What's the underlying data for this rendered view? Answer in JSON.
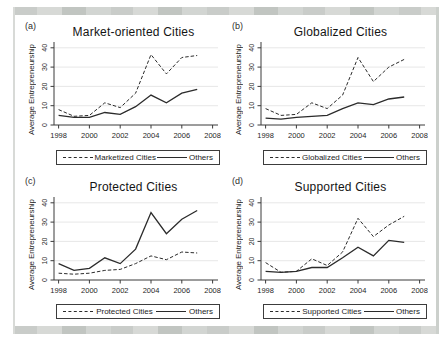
{
  "figure": {
    "background": "#ffffff",
    "frame_band_color": "#c9ccc9",
    "line_color": "#2b2b2b",
    "axis_color": "#3a3a3a",
    "grid_color": "#dcdcdc",
    "text_color": "#1f1f1f"
  },
  "axes": {
    "ylabel": "Average Entrepreneurship",
    "yticks": [
      0,
      10,
      20,
      30,
      40
    ],
    "xticks": [
      1998,
      2000,
      2002,
      2004,
      2006,
      2008
    ],
    "xrange": [
      1997.7,
      2008.35
    ],
    "yrange": [
      0,
      42.5
    ],
    "grid": "horizontal",
    "legend_position": "bottom"
  },
  "chart_data": [
    {
      "type": "line",
      "panel_label": "(a)",
      "title": "Market-oriented Cities",
      "xlabel": "",
      "ylabel": "Average Entrepreneurship",
      "ylim": [
        0,
        40
      ],
      "xlim": [
        1998,
        2008
      ],
      "x": [
        1998,
        1999,
        2000,
        2001,
        2002,
        2003,
        2004,
        2005,
        2006,
        2007
      ],
      "series": [
        {
          "name": "Marketized Cities",
          "style": "dashed",
          "values": [
            8,
            4.5,
            5,
            11.5,
            9,
            16.5,
            36.5,
            26.5,
            35,
            36
          ]
        },
        {
          "name": "Others",
          "style": "solid",
          "values": [
            5,
            4,
            4,
            6.5,
            5.5,
            9.5,
            15.5,
            11.5,
            16.5,
            18.5
          ]
        }
      ]
    },
    {
      "type": "line",
      "panel_label": "(b)",
      "title": "Globalized Cities",
      "xlabel": "",
      "ylabel": "Average Entrepreneurship",
      "ylim": [
        0,
        40
      ],
      "xlim": [
        1998,
        2008
      ],
      "x": [
        1998,
        1999,
        2000,
        2001,
        2002,
        2003,
        2004,
        2005,
        2006,
        2007
      ],
      "series": [
        {
          "name": "Globalized Cities",
          "style": "dashed",
          "values": [
            8.5,
            5,
            5.5,
            11.5,
            8.5,
            15.5,
            35,
            22.5,
            30,
            34
          ]
        },
        {
          "name": "Others",
          "style": "solid",
          "values": [
            3.5,
            3,
            4,
            4.5,
            5,
            8.5,
            11.5,
            10.5,
            13.5,
            14.5
          ]
        }
      ]
    },
    {
      "type": "line",
      "panel_label": "(c)",
      "title": "Protected Cities",
      "xlabel": "",
      "ylabel": "Average Entrepreneurship",
      "ylim": [
        0,
        40
      ],
      "xlim": [
        1998,
        2008
      ],
      "x": [
        1998,
        1999,
        2000,
        2001,
        2002,
        2003,
        2004,
        2005,
        2006,
        2007
      ],
      "series": [
        {
          "name": "Protected Cities",
          "style": "dashed",
          "values": [
            3.5,
            3,
            3.5,
            5,
            5.5,
            8.5,
            12.5,
            10.5,
            14.5,
            14
          ]
        },
        {
          "name": "Others",
          "style": "solid",
          "values": [
            8.5,
            5,
            6,
            11.5,
            8.5,
            16,
            35,
            24,
            31.5,
            36
          ]
        }
      ]
    },
    {
      "type": "line",
      "panel_label": "(d)",
      "title": "Supported Cities",
      "xlabel": "",
      "ylabel": "Average Entrepreneurship",
      "ylim": [
        0,
        40
      ],
      "xlim": [
        1998,
        2008
      ],
      "x": [
        1998,
        1999,
        2000,
        2001,
        2002,
        2003,
        2004,
        2005,
        2006,
        2007
      ],
      "series": [
        {
          "name": "Supported Cities",
          "style": "dashed",
          "values": [
            9,
            4,
            4.5,
            11,
            7.5,
            14.5,
            32,
            22.5,
            28.5,
            33
          ]
        },
        {
          "name": "Others",
          "style": "solid",
          "values": [
            4.5,
            4,
            4.5,
            6.5,
            6.5,
            11.5,
            17,
            12.5,
            20.5,
            19.5
          ]
        }
      ]
    }
  ]
}
